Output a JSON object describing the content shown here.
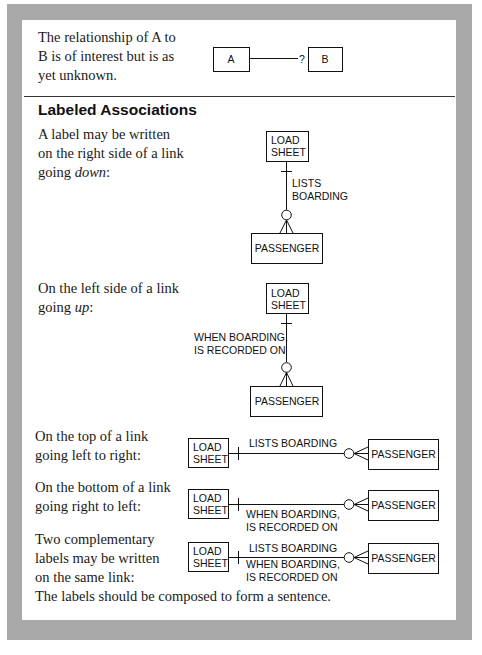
{
  "intro": {
    "text": "The relationship of A to\nB is of interest but is as\nyet unknown.",
    "diagram": {
      "left_entity": "A",
      "right_entity": "B",
      "unknown_marker": "?"
    }
  },
  "section": {
    "heading": "Labeled Associations",
    "examples": [
      {
        "text_before": "A label may be written\non the right side of a link\ngoing ",
        "text_emphasis": "down",
        "text_after": ":",
        "orientation": "vertical",
        "top_entity": [
          "LOAD",
          "SHEET"
        ],
        "bottom_entity": "PASSENGER",
        "labels": [
          "LISTS",
          "BOARDING"
        ],
        "label_side": "right"
      },
      {
        "text_before": "On the left side of a link\ngoing ",
        "text_emphasis": "up",
        "text_after": ":",
        "orientation": "vertical",
        "top_entity": [
          "LOAD",
          "SHEET"
        ],
        "bottom_entity": "PASSENGER",
        "labels": [
          "WHEN BOARDING,",
          "IS RECORDED ON"
        ],
        "label_side": "left"
      },
      {
        "text": "On the top of a link\ngoing left to right:",
        "orientation": "horizontal",
        "left_entity": [
          "LOAD",
          "SHEET"
        ],
        "right_entity": "PASSENGER",
        "top_labels": [
          "LISTS BOARDING"
        ],
        "bottom_labels": []
      },
      {
        "text": "On the bottom of a link\ngoing right to left:",
        "orientation": "horizontal",
        "left_entity": [
          "LOAD",
          "SHEET"
        ],
        "right_entity": "PASSENGER",
        "top_labels": [],
        "bottom_labels": [
          "WHEN BOARDING,",
          "IS RECORDED ON"
        ]
      },
      {
        "text": "Two complementary\nlabels may be written\non the same link:",
        "orientation": "horizontal",
        "left_entity": [
          "LOAD",
          "SHEET"
        ],
        "right_entity": "PASSENGER",
        "top_labels": [
          "LISTS BOARDING"
        ],
        "bottom_labels": [
          "WHEN BOARDING,",
          "IS RECORDED ON"
        ]
      }
    ],
    "conclusion": "The labels should be composed to form a sentence."
  },
  "colors": {
    "frame": "#a9a9a9",
    "page": "#ffffff",
    "ink": "#111111"
  }
}
